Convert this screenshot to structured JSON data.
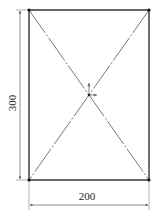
{
  "drawing": {
    "rectangle": {
      "width_label": "200",
      "height_label": "300",
      "x": 29,
      "y": 10,
      "w": 120,
      "h": 170
    },
    "dimensions": {
      "horizontal": {
        "value": "200"
      },
      "vertical": {
        "value": "300"
      }
    },
    "colors": {
      "outline": "#333333",
      "diagonal": "#555555",
      "dimension": "#444444",
      "vertex": "#111111",
      "origin_axis": "#666666"
    }
  }
}
